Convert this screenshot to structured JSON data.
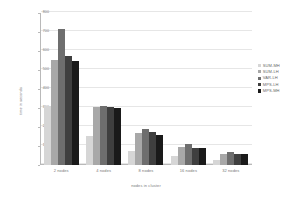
{
  "chart_data": {
    "type": "bar",
    "title": "",
    "xlabel": "nodes in cluster",
    "ylabel": "time in seconds",
    "categories": [
      "2 nodes",
      "4 nodes",
      "8 nodes",
      "16 nodes",
      "32 nodes"
    ],
    "ylim": [
      0,
      800
    ],
    "yticks": [
      0,
      100,
      200,
      300,
      400,
      500,
      600,
      700,
      800
    ],
    "ytick_labels": [
      "0",
      "100",
      "200",
      "300",
      "400",
      "500",
      "600",
      "700",
      "800"
    ],
    "grid": true,
    "legend_position": "right",
    "series": [
      {
        "name": "SUM-MH",
        "color": "#d6d6d6",
        "values": [
          310,
          152,
          72,
          47,
          26
        ]
      },
      {
        "name": "SUM-LH",
        "color": "#a8a8a8",
        "values": [
          555,
          307,
          168,
          93,
          57
        ]
      },
      {
        "name": "VAR-LH",
        "color": "#6e6e6e",
        "values": [
          718,
          312,
          192,
          112,
          66
        ]
      },
      {
        "name": "MPS-LH",
        "color": "#3f3f3f",
        "values": [
          572,
          307,
          172,
          92,
          58
        ]
      },
      {
        "name": "MPS-MH",
        "color": "#1a1a1a",
        "values": [
          548,
          300,
          160,
          90,
          56
        ]
      }
    ]
  },
  "legend": {
    "items": [
      {
        "label": "SUM-MH"
      },
      {
        "label": "SUM-LH"
      },
      {
        "label": "VAR-LH"
      },
      {
        "label": "MPS-LH"
      },
      {
        "label": "MPS-MH"
      }
    ]
  }
}
